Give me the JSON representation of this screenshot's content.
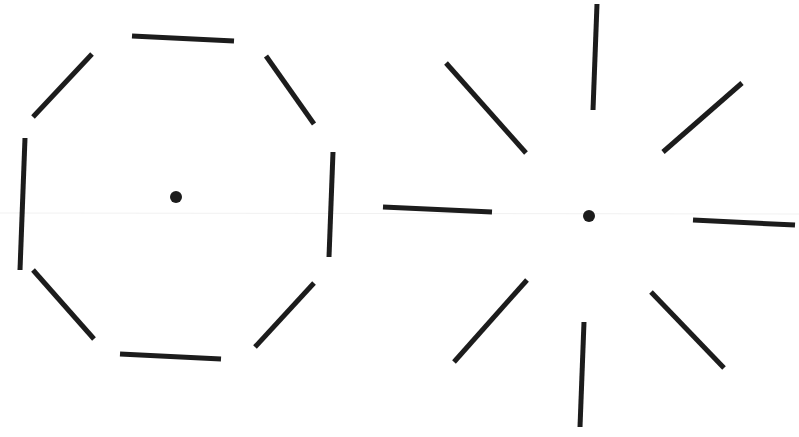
{
  "figure": {
    "background": "#ffffff",
    "stroke_color": "#1c1c1c",
    "panels": [
      {
        "name": "octagon-arrangement",
        "center": [
          176,
          197
        ],
        "dot_radius": 6,
        "segments": [
          [
            132,
            36,
            234,
            41
          ],
          [
            266,
            56,
            314,
            124
          ],
          [
            333,
            152,
            329,
            257
          ],
          [
            314,
            283,
            255,
            347
          ],
          [
            221,
            359,
            120,
            354
          ],
          [
            94,
            339,
            33,
            270
          ],
          [
            20,
            270,
            25,
            138
          ],
          [
            33,
            117,
            92,
            54
          ]
        ]
      },
      {
        "name": "radial-arrangement",
        "center": [
          589,
          216
        ],
        "dot_radius": 6,
        "segments": [
          [
            597,
            4,
            593,
            110
          ],
          [
            742,
            83,
            663,
            152
          ],
          [
            446,
            63,
            526,
            153
          ],
          [
            383,
            207,
            492,
            212
          ],
          [
            693,
            220,
            795,
            225
          ],
          [
            527,
            280,
            454,
            362
          ],
          [
            584,
            322,
            580,
            427
          ],
          [
            651,
            292,
            724,
            368
          ]
        ]
      }
    ]
  }
}
